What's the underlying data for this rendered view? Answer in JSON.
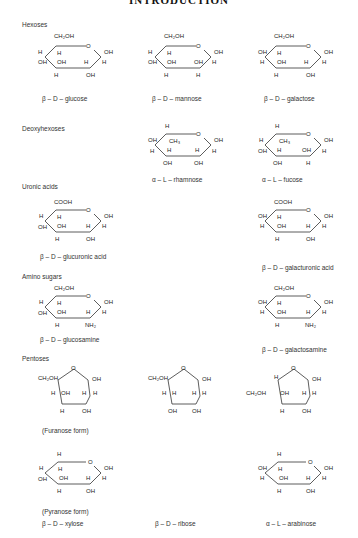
{
  "header": {
    "title": "INTRODUCTION"
  },
  "sections": {
    "hexoses": "Hexoses",
    "deoxyhexoses": "Deoxyhexoses",
    "uronic_acids": "Uronic acids",
    "amino_sugars": "Amino sugars",
    "pentoses": "Pentoses"
  },
  "captions": {
    "glucose": "β – D – glucose",
    "mannose": "β – D – mannose",
    "galactose": "β – D – galactose",
    "rhamnose": "α – L – rhamnose",
    "fucose": "α – L – fucose",
    "glucuronic": "β – D – glucuronic acid",
    "galacturonic": "β – D – galacturonic acid",
    "glucosamine": "β – D – glucosamine",
    "galactosamine": "β – D – galactosamine",
    "furanose_form": "(Furanose form)",
    "pyranose_form": "(Pyranose form)",
    "xylose": "β – D – xylose",
    "ribose": "β – D – ribose",
    "arabinose": "α – L – arabinose"
  },
  "molecules": {
    "glucose": {
      "top": "CH₂OH",
      "c5": "H",
      "c4_up": "H",
      "c4_down": "OH",
      "c3_up": "OH",
      "c3_down": "H",
      "c2_up": "H",
      "c2_down": "OH",
      "c1_up": "OH",
      "c1_down": "H",
      "c5_down": "H"
    },
    "mannose": {
      "top": "CH₂OH",
      "c4_up": "H",
      "c4_down": "OH",
      "c3_up": "OH",
      "c3_down": "H",
      "c2_up": "OH",
      "c2_down": "H",
      "c1_up": "OH",
      "c1_down": "H",
      "c5_down": "H"
    },
    "galactose": {
      "top": "CH₂OH",
      "c4_up": "OH",
      "c4_down": "H",
      "c3_up": "OH",
      "c3_down": "H",
      "c2_up": "H",
      "c2_down": "OH",
      "c1_up": "OH",
      "c1_down": "H",
      "c5_down": "H"
    },
    "rhamnose": {
      "top": "H",
      "c5_down": "CH₃",
      "c4_up": "OH",
      "c4_down": "H",
      "c3_up": "H",
      "c3_down": "OH",
      "c2_up": "H",
      "c2_down": "OH",
      "c1_up": "OH",
      "c1_down": "H"
    },
    "fucose": {
      "top": "H",
      "c5_down": "CH₃",
      "c4_up": "H",
      "c4_down": "OH",
      "c3_up": "H",
      "c3_down": "OH",
      "c2_up": "OH",
      "c2_down": "H",
      "c1_up": "OH",
      "c1_down": "H"
    },
    "glucuronic": {
      "top": "COOH",
      "c5_down": "H",
      "c4_up": "H",
      "c4_down": "OH",
      "c3_up": "OH",
      "c3_down": "H",
      "c2_up": "H",
      "c2_down": "OH",
      "c1_up": "OH",
      "c1_down": "H"
    },
    "galacturonic": {
      "top": "COOH",
      "c5_down": "H",
      "c4_up": "OH",
      "c4_down": "H",
      "c3_up": "OH",
      "c3_down": "H",
      "c2_up": "H",
      "c2_down": "OH",
      "c1_up": "OH",
      "c1_down": "H"
    },
    "glucosamine": {
      "top": "CH₂OH",
      "c5_down": "H",
      "c4_up": "H",
      "c4_down": "OH",
      "c3_up": "OH",
      "c3_down": "H",
      "c2_up": "H",
      "c2_down": "NH₂",
      "c1_up": "OH",
      "c1_down": "H"
    },
    "galactosamine": {
      "top": "CH₂OH",
      "c5_down": "H",
      "c4_up": "OH",
      "c4_down": "H",
      "c3_up": "OH",
      "c3_down": "H",
      "c2_up": "H",
      "c2_down": "NH₂",
      "c1_up": "OH",
      "c1_down": "H"
    },
    "xylose_furanose": {
      "c4_left": "CH₂OH",
      "c3_up": "H",
      "c3_in": "OH",
      "c3_down": "H",
      "c2_up": "H",
      "c2_in": "H",
      "c2_down": "OH",
      "c1_up": "OH"
    },
    "ribose_furanose": {
      "c4_left": "CH₂OH",
      "c3_up": "H",
      "c3_in": "H",
      "c3_down": "OH",
      "c2_up": "H",
      "c2_in": "H",
      "c2_down": "OH",
      "c1_up": "OH"
    },
    "arabinose_furanose": {
      "c4_up": "H",
      "c4_left": "CH₂OH",
      "c3_in": "OH",
      "c3_down": "H",
      "c2_up": "H",
      "c2_in": "H",
      "c2_down": "OH",
      "c1_up": "OH"
    },
    "xylose_pyranose": {
      "top": "H",
      "c5_down": "H",
      "c4_up": "H",
      "c4_down": "OH",
      "c3_up": "OH",
      "c3_down": "H",
      "c2_up": "H",
      "c2_down": "OH",
      "c1_up": "OH",
      "c1_down": "H"
    },
    "arabinose_pyranose": {
      "top": "H",
      "c5_down": "H",
      "c4_up": "OH",
      "c4_down": "H",
      "c3_up": "OH",
      "c3_down": "H",
      "c2_up": "H",
      "c2_down": "OH",
      "c1_up": "OH",
      "c1_down": "H"
    },
    "ring_oxygen": "O"
  }
}
